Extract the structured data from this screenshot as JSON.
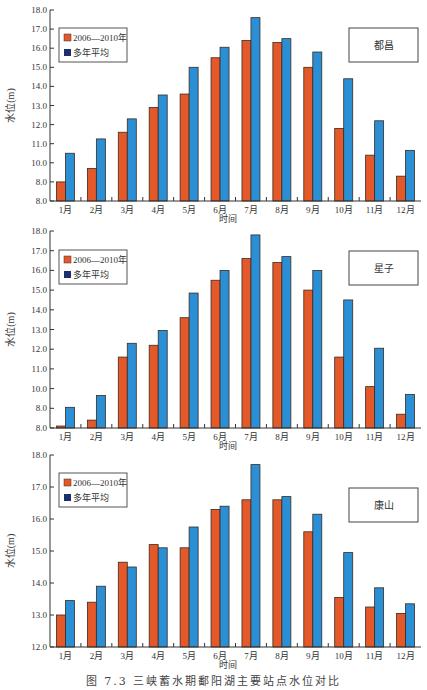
{
  "caption": "图 7.3  三峡蓄水期鄱阳湖主要站点水位对比",
  "colors": {
    "series_recent": "#e4592a",
    "series_avg": "#2b8fd6",
    "legend_avg_swatch": "#1f2f6e",
    "axis": "#333333",
    "bar_edge": "#3a2a20"
  },
  "chart_data": [
    {
      "type": "bar",
      "title": "都昌",
      "xlabel": "时间",
      "ylabel": "水位(m)",
      "categories": [
        "1月",
        "2月",
        "3月",
        "4月",
        "5月",
        "6月",
        "7月",
        "8月",
        "9月",
        "10月",
        "11月",
        "12月"
      ],
      "yticks": [
        8.0,
        9.0,
        10.0,
        11.0,
        12.0,
        13.0,
        14.0,
        15.0,
        16.0,
        17.0,
        18.0
      ],
      "ytick_labels": [
        "8.0",
        "8.0",
        "10.0",
        "11.0",
        "12.0",
        "13.0",
        "14.0",
        "15.0",
        "16.0",
        "17.0",
        "18.0"
      ],
      "ylim": [
        8.0,
        18.0
      ],
      "legend": [
        "2006—2010年",
        "多年平均"
      ],
      "series": [
        {
          "name": "2006—2010年",
          "values": [
            9.0,
            9.7,
            11.6,
            12.9,
            13.6,
            15.5,
            16.4,
            16.3,
            15.0,
            11.8,
            10.4,
            9.3
          ]
        },
        {
          "name": "多年平均",
          "values": [
            10.5,
            11.25,
            12.3,
            13.55,
            15.0,
            16.05,
            17.6,
            16.5,
            15.8,
            14.4,
            12.2,
            10.65
          ]
        }
      ]
    },
    {
      "type": "bar",
      "title": "星子",
      "xlabel": "时间",
      "ylabel": "水位(m)",
      "categories": [
        "1月",
        "2月",
        "3月",
        "4月",
        "5月",
        "6月",
        "7月",
        "8月",
        "9月",
        "10月",
        "11月",
        "12月"
      ],
      "yticks": [
        8.0,
        9.0,
        10.0,
        11.0,
        12.0,
        13.0,
        14.0,
        15.0,
        16.0,
        17.0,
        18.0
      ],
      "ytick_labels": [
        "8.0",
        "8.0",
        "10.0",
        "11.0",
        "12.0",
        "13.0",
        "14.0",
        "15.0",
        "16.0",
        "17.0",
        "18.0"
      ],
      "ylim": [
        8.0,
        18.0
      ],
      "legend": [
        "2006—2010年",
        "多年平均"
      ],
      "series": [
        {
          "name": "2006—2010年",
          "values": [
            8.1,
            8.4,
            11.6,
            12.2,
            13.6,
            15.5,
            16.6,
            16.4,
            15.0,
            11.6,
            10.1,
            8.7
          ]
        },
        {
          "name": "多年平均",
          "values": [
            9.05,
            9.65,
            12.3,
            12.95,
            14.85,
            16.0,
            17.8,
            16.7,
            16.0,
            14.5,
            12.05,
            9.7
          ]
        }
      ]
    },
    {
      "type": "bar",
      "title": "康山",
      "xlabel": "时间",
      "ylabel": "水位(m)",
      "categories": [
        "1月",
        "2月",
        "3月",
        "4月",
        "5月",
        "6月",
        "7月",
        "8月",
        "9月",
        "10月",
        "11月",
        "12月"
      ],
      "yticks": [
        12.0,
        13.0,
        14.0,
        15.0,
        16.0,
        17.0,
        18.0
      ],
      "ytick_labels": [
        "12.0",
        "13.0",
        "14.0",
        "15.0",
        "16.0",
        "17.0",
        "18.0"
      ],
      "ylim": [
        12.0,
        18.0
      ],
      "legend": [
        "2006—2010年",
        "多年平均"
      ],
      "series": [
        {
          "name": "2006—2010年",
          "values": [
            13.0,
            13.4,
            14.65,
            15.2,
            15.1,
            16.3,
            16.6,
            16.6,
            15.6,
            13.55,
            13.25,
            13.05
          ]
        },
        {
          "name": "多年平均",
          "values": [
            13.45,
            13.9,
            14.5,
            15.1,
            15.75,
            16.4,
            17.7,
            16.7,
            16.15,
            14.95,
            13.85,
            13.35
          ]
        }
      ]
    }
  ]
}
